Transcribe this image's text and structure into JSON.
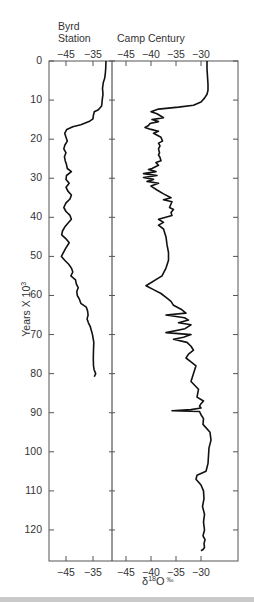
{
  "chart_data": {
    "type": "line",
    "title": "",
    "ylabel": "Years X 10^3",
    "xlabel": "δ18O ‰",
    "ylim": [
      0,
      128
    ],
    "y_ticks": [
      0,
      10,
      20,
      30,
      40,
      50,
      60,
      70,
      80,
      90,
      100,
      110,
      120
    ],
    "orientation": "vertical-depth",
    "panels": [
      {
        "name": "Byrd Station",
        "title_lines": [
          "Byrd",
          "Station"
        ],
        "xlim": [
          -51.5,
          -28.8
        ],
        "x_ticks": [
          -45,
          -35
        ],
        "series": {
          "x": [
            -30.2,
            -30.3,
            -30.5,
            -30.7,
            -31.2,
            -31.5,
            -31.3,
            -31.6,
            -31.7,
            -31.8,
            -33.0,
            -34.5,
            -34.9,
            -35.0,
            -36.5,
            -39.5,
            -42.5,
            -44.7,
            -45.5,
            -45.0,
            -44.5,
            -45.4,
            -45.8,
            -45.0,
            -45.6,
            -45.3,
            -44.8,
            -44.5,
            -43.0,
            -44.8,
            -45.0,
            -43.8,
            -45.0,
            -44.3,
            -43.0,
            -43.5,
            -45.0,
            -45.8,
            -45.0,
            -43.5,
            -43.0,
            -44.3,
            -45.5,
            -46.3,
            -46.6,
            -45.0,
            -43.8,
            -45.2,
            -46.7,
            -45.5,
            -44.0,
            -43.0,
            -42.5,
            -43.2,
            -41.5,
            -41.2,
            -40.5,
            -41.0,
            -40.8,
            -40.0,
            -39.5,
            -37.5,
            -37.0,
            -36.8,
            -37.2,
            -36.7,
            -36.0,
            -35.2,
            -34.7,
            -34.8,
            -34.9,
            -34.8,
            -34.6,
            -34.0,
            -34.5
          ],
          "y": [
            0,
            2,
            3.5,
            4.5,
            5.5,
            7,
            8.5,
            10,
            11,
            11.5,
            12.5,
            13,
            14,
            14.8,
            15.5,
            16.3,
            16.8,
            17.5,
            18.5,
            19.5,
            20.5,
            21.5,
            22.5,
            23.5,
            24.5,
            25.5,
            26.5,
            27.5,
            28.3,
            29.3,
            30.3,
            31.3,
            32.3,
            33.3,
            34.3,
            35.3,
            36.3,
            37.5,
            38.5,
            39.5,
            40.5,
            41.5,
            42.5,
            43.5,
            44.5,
            45.5,
            46.5,
            48,
            50,
            51,
            52,
            53,
            54,
            55,
            56,
            57,
            58,
            59,
            60,
            61,
            62,
            63,
            64,
            65,
            66,
            67,
            68,
            70,
            72,
            74,
            76,
            78,
            79,
            80,
            80.8
          ]
        }
      },
      {
        "name": "Camp Century",
        "title_lines": [
          "Camp Century"
        ],
        "xlim": [
          -47.8,
          -20.4
        ],
        "x_ticks": [
          -45,
          -40,
          -35,
          -30
        ],
        "series": {
          "x": [
            -28.8,
            -28.8,
            -28.7,
            -28.6,
            -28.6,
            -28.8,
            -29.3,
            -30.0,
            -31.5,
            -34.5,
            -38.5,
            -40.0,
            -38.8,
            -37.5,
            -39.8,
            -38.5,
            -40.2,
            -40.5,
            -41.2,
            -40.0,
            -38.5,
            -39.5,
            -38.0,
            -37.7,
            -38.5,
            -38.2,
            -38.5,
            -38.3,
            -38.5,
            -38.2,
            -38.0,
            -39.0,
            -38.5,
            -39.8,
            -40.5,
            -39.0,
            -41.5,
            -38.8,
            -41.5,
            -39.5,
            -40.8,
            -38.5,
            -40.0,
            -38.8,
            -37.5,
            -36.0,
            -37.5,
            -35.8,
            -36.3,
            -35.5,
            -36.0,
            -35.8,
            -38.5,
            -37.5,
            -38.5,
            -37.5,
            -37.0,
            -36.8,
            -36.5,
            -36.5,
            -37.0,
            -37.8,
            -41.0,
            -39.5,
            -38.0,
            -37.0,
            -36.0,
            -35.5,
            -34.0,
            -33.0,
            -37.0,
            -33.3,
            -32.5,
            -34.5,
            -32.0,
            -33.2,
            -37.0,
            -32.0,
            -33.5,
            -35.5,
            -32.8,
            -32.0,
            -31.5,
            -32.5,
            -33.0,
            -32.0,
            -31.0,
            -31.5,
            -32.0,
            -30.5,
            -30.8,
            -29.5,
            -30.0,
            -30.3,
            -30.0,
            -32.0,
            -35.8,
            -30.3,
            -30.0,
            -29.5,
            -29.6,
            -28.2,
            -28.0,
            -28.4,
            -28.5,
            -28.6,
            -29.0,
            -30.8,
            -31.0,
            -30.0,
            -29.5,
            -29.4,
            -29.7,
            -29.3,
            -29.5,
            -29.3,
            -29.6,
            -29.2,
            -29.4,
            -29.3,
            -29.6,
            -30.0
          ],
          "y": [
            0,
            2,
            4,
            6,
            7.5,
            8.5,
            9.5,
            10.5,
            11.3,
            11.8,
            12.3,
            13.0,
            13.5,
            14.5,
            15.0,
            15.5,
            16.0,
            16.5,
            17.0,
            17.5,
            18.0,
            18.5,
            19.5,
            20.5,
            21.0,
            21.7,
            22.5,
            23.5,
            24.0,
            24.7,
            25.5,
            26.0,
            26.7,
            27.5,
            27.8,
            28.3,
            28.8,
            29.3,
            29.8,
            30.3,
            30.8,
            31.3,
            32.0,
            33.0,
            34.0,
            35.0,
            35.5,
            36.0,
            37.5,
            38.0,
            38.8,
            39.5,
            40.5,
            41.3,
            42.0,
            43.0,
            45.0,
            47.0,
            49.0,
            51.0,
            53.0,
            55.0,
            57.5,
            58.5,
            59.5,
            60.5,
            61.5,
            62.5,
            63.5,
            64.5,
            65.0,
            65.7,
            66.3,
            67.0,
            67.5,
            68.5,
            69.5,
            70.0,
            70.7,
            71.2,
            72.0,
            73.0,
            74.0,
            75.0,
            76.0,
            77.0,
            78.0,
            80.0,
            82.0,
            84.0,
            86.0,
            87.0,
            87.7,
            88.3,
            88.8,
            89.2,
            89.5,
            89.7,
            90.5,
            91.5,
            93.0,
            95.0,
            97.0,
            99.0,
            101.0,
            103.0,
            105.0,
            106.0,
            107.0,
            108.5,
            110.0,
            112.0,
            114.0,
            116.0,
            118.0,
            120.0,
            121.5,
            122.5,
            123.5,
            124.5,
            125.0,
            125.3
          ]
        }
      }
    ],
    "grid": false,
    "legend": null
  },
  "labels": {
    "byrd_title_1": "Byrd",
    "byrd_title_2": "Station",
    "camp_title": "Camp Century",
    "y_axis_label": "Years X 10",
    "y_axis_sup": "3",
    "x_axis_delta": "δ",
    "x_axis_sup": "18",
    "x_axis_O": "O",
    "x_axis_permil": "‰",
    "byrd_ticks": [
      "−45",
      "−35"
    ],
    "camp_ticks": [
      "−45",
      "−40",
      "−35",
      "−30"
    ],
    "y_ticks": [
      "0",
      "10",
      "20",
      "30",
      "40",
      "50",
      "60",
      "70",
      "80",
      "90",
      "100",
      "110",
      "120"
    ]
  },
  "colors": {
    "line": "#111111",
    "axis": "#555555",
    "text": "#333333"
  }
}
